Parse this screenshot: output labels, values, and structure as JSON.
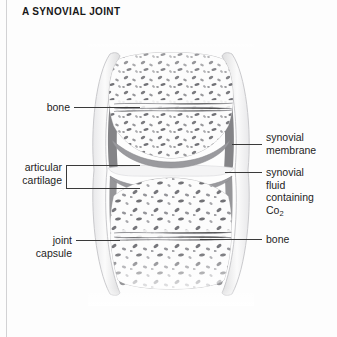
{
  "figure": {
    "title": "A SYNOVIAL JOINT",
    "style": "grayscale pencil anatomical illustration"
  },
  "labels": {
    "left": [
      {
        "id": "bone-upper",
        "text": "bone",
        "lines": [
          "bone"
        ]
      },
      {
        "id": "articular-cartilage",
        "text": "articular cartilage",
        "lines": [
          "articular",
          "cartilage"
        ]
      },
      {
        "id": "joint-capsule",
        "text": "joint capsule",
        "lines": [
          "joint",
          "capsule"
        ]
      }
    ],
    "right": [
      {
        "id": "synovial-membrane",
        "text": "synovial membrane",
        "lines": [
          "synovial",
          "membrane"
        ]
      },
      {
        "id": "synovial-fluid",
        "text": "synovial fluid containing Co2",
        "lines": [
          "synovial",
          "fluid",
          "containing"
        ],
        "formula_prefix": "Co",
        "formula_sub": "2"
      },
      {
        "id": "bone-lower",
        "text": "bone",
        "lines": [
          "bone"
        ]
      }
    ]
  },
  "anatomy": {
    "parts": [
      "upper bone epiphysis with trabecular (spongy) bone",
      "lower bone epiphysis with trabecular (spongy) bone",
      "articular cartilage caps on both bone ends",
      "joint cavity filled with synovial fluid",
      "synovial membrane lining the capsule",
      "fibrous joint capsule enclosing the joint"
    ]
  },
  "colors": {
    "page_background": "#fdfdfd",
    "margin_rule": "#d2d2d4",
    "title_text": "#171717",
    "label_text": "#1e1e1e",
    "leader_line": "#3a3a3a",
    "bone_fill": "#fbfbfb",
    "bone_outline": "#b9b9bb",
    "trabecula_dark": "#5a5a5e",
    "trabecula_mid": "#8e8e92",
    "cartilage": "#9a9a9e",
    "synovial_membrane": "#6e6e72",
    "capsule_wall": "#cfcfd2",
    "synovial_fluid": "#f4f4f5"
  }
}
